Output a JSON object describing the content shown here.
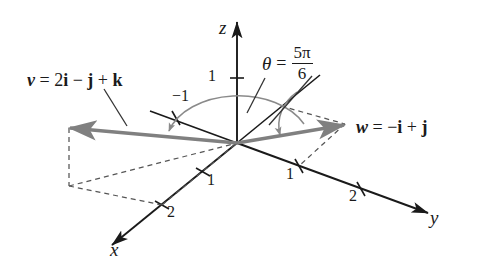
{
  "figure": {
    "background_color": "#ffffff",
    "axis_color": "#1a1a1a",
    "vector_color": "#808080",
    "dashed_color": "#555555",
    "arc_color": "#8a8a8a",
    "leader_color": "#333333"
  },
  "axes": [
    {
      "name": "x-axis",
      "label": "x"
    },
    {
      "name": "y-axis",
      "label": "y"
    },
    {
      "name": "z-axis",
      "label": "z"
    }
  ],
  "ticks": {
    "x": [
      "1",
      "2"
    ],
    "y": [
      "1",
      "2"
    ],
    "y_negative": [
      "−1"
    ],
    "z": [
      "1"
    ]
  },
  "vectors": [
    {
      "name": "v",
      "label_symbol": "v",
      "label_equals": "=",
      "label_expression": "2i − j + k",
      "components": [
        2,
        -1,
        1
      ],
      "parts": [
        {
          "text": "v",
          "style": "bold-italic"
        },
        {
          "text": " = ",
          "style": "plain"
        },
        {
          "text": "2",
          "style": "plain"
        },
        {
          "text": "i",
          "style": "bold"
        },
        {
          "text": " − ",
          "style": "plain"
        },
        {
          "text": "j",
          "style": "bold"
        },
        {
          "text": " + ",
          "style": "plain"
        },
        {
          "text": "k",
          "style": "bold"
        }
      ]
    },
    {
      "name": "w",
      "label_symbol": "w",
      "label_equals": "=",
      "label_expression": "−i + j",
      "components": [
        -1,
        1,
        0
      ],
      "parts": [
        {
          "text": "w",
          "style": "bold-italic"
        },
        {
          "text": " = ",
          "style": "plain"
        },
        {
          "text": "−",
          "style": "plain"
        },
        {
          "text": "i",
          "style": "bold"
        },
        {
          "text": " + ",
          "style": "plain"
        },
        {
          "text": "j",
          "style": "bold"
        }
      ]
    }
  ],
  "angle": {
    "symbol": "θ",
    "equals": "=",
    "numerator": "5π",
    "denominator": "6",
    "value_text": "θ = 5π/6"
  }
}
